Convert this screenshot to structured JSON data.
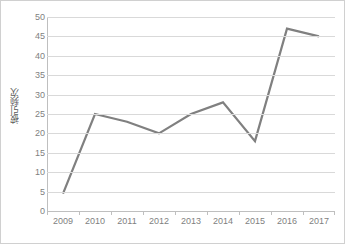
{
  "chart_data": {
    "type": "line",
    "title": "",
    "xlabel": "",
    "ylabel": "被引频次",
    "categories": [
      "2009",
      "2010",
      "2011",
      "2012",
      "2013",
      "2014",
      "2015",
      "2016",
      "2017"
    ],
    "values": [
      4.5,
      25,
      23,
      20,
      25,
      28,
      18,
      47,
      45
    ],
    "series": [
      {
        "name": "被引频次",
        "values": [
          4.5,
          25,
          23,
          20,
          25,
          28,
          18,
          47,
          45
        ],
        "color": "#808080"
      }
    ],
    "ylim": [
      0,
      50
    ],
    "ytick_values": [
      0,
      5,
      10,
      15,
      20,
      25,
      30,
      35,
      40,
      45,
      50
    ],
    "ytick_labels": [
      "0",
      "5",
      "10",
      "15",
      "20",
      "25",
      "30",
      "35",
      "40",
      "45",
      "50"
    ],
    "grid": true,
    "grid_axis": "y",
    "legend": false,
    "legend_position": "none",
    "markers": false
  },
  "style": {
    "line_color": "#808080",
    "grid_color": "#d9d9d9",
    "axis_color": "#bfbfbf",
    "tick_label_color": "#7f7f7f",
    "axis_title_color": "#595959",
    "background": "#ffffff",
    "border_color": "#d0d0d0",
    "line_width": "2.2"
  }
}
